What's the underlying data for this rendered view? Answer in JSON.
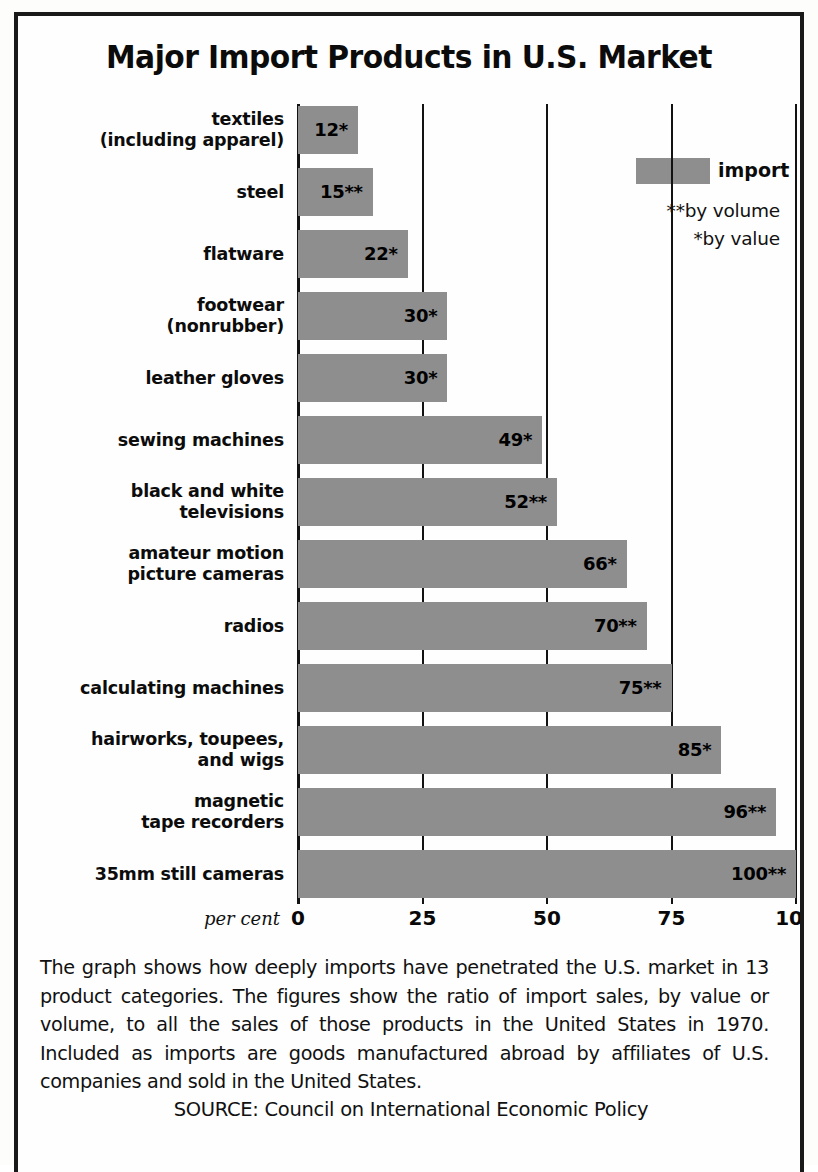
{
  "chart_data": {
    "type": "bar",
    "orientation": "horizontal",
    "title": "Major Import Products in U.S. Market",
    "xlabel": "per cent",
    "ylabel": "",
    "xlim": [
      0,
      100
    ],
    "xticks": [
      "0",
      "25",
      "50",
      "75",
      "100"
    ],
    "xtick_values": [
      0,
      25,
      50,
      75,
      100
    ],
    "grid": true,
    "legend": {
      "position": "top-right",
      "entries": [
        "import"
      ],
      "notes": [
        "**by volume",
        "*by value"
      ]
    },
    "categories": [
      "textiles\n(including apparel)",
      "steel",
      "flatware",
      "footwear\n(nonrubber)",
      "leather gloves",
      "sewing machines",
      "black and white\ntelevisions",
      "amateur motion\npicture cameras",
      "radios",
      "calculating machines",
      "hairworks, toupees,\nand wigs",
      "magnetic\ntape recorders",
      "35mm still cameras"
    ],
    "values": [
      12,
      15,
      22,
      30,
      30,
      49,
      52,
      66,
      70,
      75,
      85,
      96,
      100
    ],
    "data_labels": [
      "12*",
      "15**",
      "22*",
      "30*",
      "30*",
      "49*",
      "52**",
      "66*",
      "70**",
      "75**",
      "85*",
      "96**",
      "100**"
    ],
    "bars": [
      {
        "label_line1": "textiles",
        "label_line2": "(including apparel)",
        "value": 12,
        "data_label": "12*",
        "measure": "by value"
      },
      {
        "label_line1": "steel",
        "label_line2": "",
        "value": 15,
        "data_label": "15**",
        "measure": "by volume"
      },
      {
        "label_line1": "flatware",
        "label_line2": "",
        "value": 22,
        "data_label": "22*",
        "measure": "by value"
      },
      {
        "label_line1": "footwear",
        "label_line2": "(nonrubber)",
        "value": 30,
        "data_label": "30*",
        "measure": "by value"
      },
      {
        "label_line1": "leather gloves",
        "label_line2": "",
        "value": 30,
        "data_label": "30*",
        "measure": "by value"
      },
      {
        "label_line1": "sewing machines",
        "label_line2": "",
        "value": 49,
        "data_label": "49*",
        "measure": "by value"
      },
      {
        "label_line1": "black and white",
        "label_line2": "televisions",
        "value": 52,
        "data_label": "52**",
        "measure": "by volume"
      },
      {
        "label_line1": "amateur motion",
        "label_line2": "picture cameras",
        "value": 66,
        "data_label": "66*",
        "measure": "by value"
      },
      {
        "label_line1": "radios",
        "label_line2": "",
        "value": 70,
        "data_label": "70**",
        "measure": "by volume"
      },
      {
        "label_line1": "calculating machines",
        "label_line2": "",
        "value": 75,
        "data_label": "75**",
        "measure": "by volume"
      },
      {
        "label_line1": "hairworks, toupees,",
        "label_line2": "and wigs",
        "value": 85,
        "data_label": "85*",
        "measure": "by value"
      },
      {
        "label_line1": "magnetic",
        "label_line2": "tape recorders",
        "value": 96,
        "data_label": "96**",
        "measure": "by volume"
      },
      {
        "label_line1": "35mm still cameras",
        "label_line2": "",
        "value": 100,
        "data_label": "100**",
        "measure": "by volume"
      }
    ],
    "colors": {
      "bar_fill": "#8e8e8e",
      "axis": "#121212",
      "text": "#111111",
      "background": "#fefefe"
    }
  },
  "title": "Major Import Products in U.S. Market",
  "legend": {
    "swatch_label": "import",
    "note_volume": "**by volume",
    "note_value": "*by value"
  },
  "axis": {
    "unit": "per cent",
    "tick_0": "0",
    "tick_25": "25",
    "tick_50": "50",
    "tick_75": "75",
    "tick_100": "100"
  },
  "caption": {
    "body": "The graph shows how deeply imports have penetrated the U.S. market in 13 product categories. The figures show the ratio of import sales, by value or volume, to all the sales of those products in the United States in 1970. Included as imports are goods manufactured abroad by affiliates of U.S. companies and sold in the United States.",
    "source": "SOURCE: Council on International Economic Policy"
  }
}
